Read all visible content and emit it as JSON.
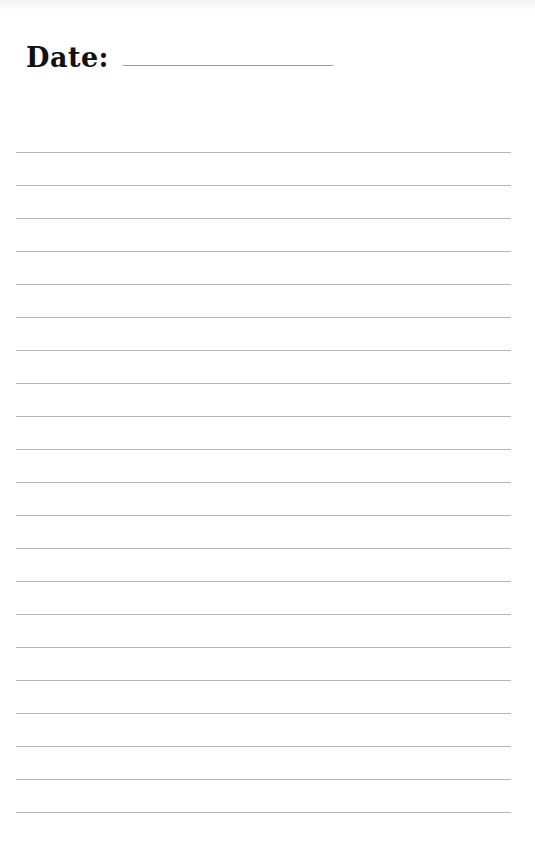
{
  "page": {
    "type": "lined-notebook-page",
    "background": "#ffffff",
    "line_color": "#b5b5b5"
  },
  "header": {
    "date_label": "Date:",
    "date_value": ""
  },
  "lines": {
    "count": 21,
    "first_y": 152,
    "spacing": 33
  }
}
